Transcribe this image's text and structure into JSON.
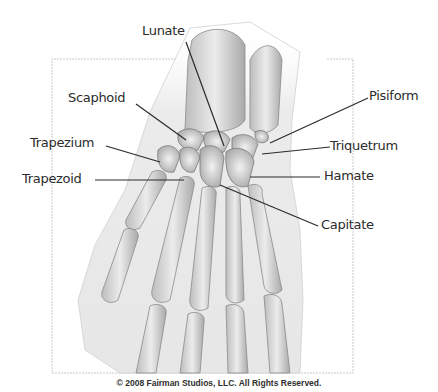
{
  "figure": {
    "frame_color": "#c8c8c8",
    "line_color": "#2b2b2b",
    "bone_fill": "#dcdcdc",
    "bone_shadow": "#9a9a9a"
  },
  "labels": {
    "lunate": "Lunate",
    "scaphoid": "Scaphoid",
    "trapezium": "Trapezium",
    "trapezoid": "Trapezoid",
    "pisiform": "Pisiform",
    "triquetrum": "Triquetrum",
    "hamate": "Hamate",
    "capitate": "Capitate"
  },
  "footer": {
    "copyright": "© 2008 Fairman Studios, LLC. All Rights Reserved."
  }
}
